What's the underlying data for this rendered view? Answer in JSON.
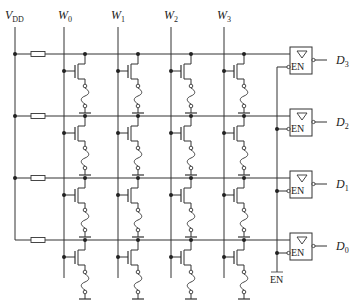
{
  "diagram": {
    "type": "ROM memory array (fuse-programmable, 4x4)",
    "supply": {
      "label": "V",
      "sub": "DD"
    },
    "word_lines": [
      {
        "label": "W",
        "sub": "0"
      },
      {
        "label": "W",
        "sub": "1"
      },
      {
        "label": "W",
        "sub": "2"
      },
      {
        "label": "W",
        "sub": "3"
      }
    ],
    "outputs": [
      {
        "label": "D",
        "sub": "3"
      },
      {
        "label": "D",
        "sub": "2"
      },
      {
        "label": "D",
        "sub": "1"
      },
      {
        "label": "D",
        "sub": "0"
      }
    ],
    "buffer": {
      "symbol": "▽",
      "enable_label": "EN"
    },
    "enable_input": {
      "label": "EN",
      "active_low": true
    },
    "colors": {
      "line": "#333333",
      "background": "#ffffff"
    }
  }
}
